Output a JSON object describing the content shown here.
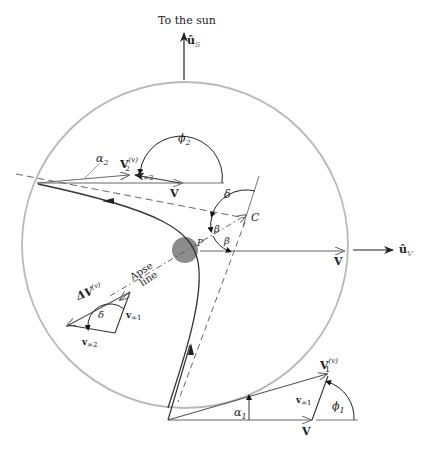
{
  "figure": {
    "type": "planetary flyby geometry (trailing-side flyby)",
    "colors": {
      "circle": "#b8b8b8",
      "planet": "#8c8c8c",
      "line": "#333333",
      "gray_vector": "#777777"
    }
  },
  "labels": {
    "to_the_sun": "To the sun",
    "u_s": "û",
    "u_s_sub": "S",
    "u_v": "û",
    "u_v_sub": "V",
    "phi2": "ϕ",
    "phi2_sub": "2",
    "phi1": "ϕ",
    "phi1_sub": "1",
    "alpha2": "α",
    "alpha2_sub": "2",
    "alpha1": "α",
    "alpha1_sub": "1",
    "V2v": "V",
    "V2v_sub": "2",
    "V2v_sup": "(v)",
    "V1v": "V",
    "V1v_sub": "1",
    "V1v_sup": "(v)",
    "vinf2": "v",
    "vinf2_sub": "∞2",
    "vinf1": "v",
    "vinf1_sub": "∞1",
    "V_top": "V",
    "V_mid": "V",
    "V_bottom": "V",
    "delta_top": "δ",
    "delta_triangle": "δ",
    "beta_upper": "β",
    "beta_lower": "β",
    "C": "C",
    "P": "P",
    "apse_line_1": "Apse",
    "apse_line_2": "line",
    "dV": "ΔV",
    "dV_sup": "(v)",
    "tri_vinf1": "v",
    "tri_vinf1_sub": "∞1",
    "tri_vinf2": "v",
    "tri_vinf2_sub": "∞2"
  }
}
